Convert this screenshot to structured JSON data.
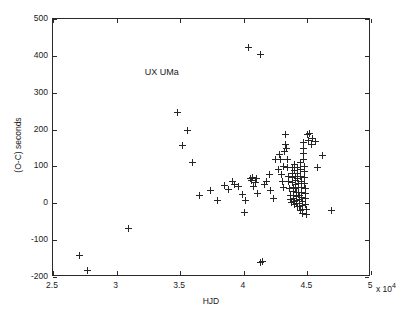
{
  "chart_data": {
    "type": "scatter",
    "title": "",
    "annotation": "UX UMa",
    "xlabel": "HJD",
    "ylabel": "(O-C) seconds",
    "x_exponent_label": "x 10",
    "x_exponent_sup": "4",
    "xlim": [
      25000,
      50000
    ],
    "ylim": [
      -200,
      500
    ],
    "xticks": [
      25000,
      30000,
      35000,
      40000,
      45000,
      50000
    ],
    "xticklabels": [
      "2.5",
      "3",
      "3.5",
      "4",
      "4.5",
      "5"
    ],
    "yticks": [
      -200,
      -100,
      0,
      100,
      200,
      300,
      400,
      500
    ],
    "yticklabels": [
      "-200",
      "-100",
      "0",
      "100",
      "200",
      "300",
      "400",
      "500"
    ],
    "grid": false,
    "legend": null,
    "marker": "plus",
    "marker_color": "#262626",
    "points": [
      [
        27100,
        -143
      ],
      [
        27700,
        -182
      ],
      [
        30900,
        -68
      ],
      [
        34800,
        247
      ],
      [
        35200,
        158
      ],
      [
        35600,
        198
      ],
      [
        36000,
        110
      ],
      [
        36500,
        20
      ],
      [
        37400,
        35
      ],
      [
        37900,
        8
      ],
      [
        38500,
        48
      ],
      [
        38800,
        38
      ],
      [
        39100,
        58
      ],
      [
        39300,
        52
      ],
      [
        39600,
        46
      ],
      [
        39900,
        24
      ],
      [
        40050,
        -24
      ],
      [
        40150,
        8
      ],
      [
        40400,
        422
      ],
      [
        40500,
        66
      ],
      [
        40600,
        62
      ],
      [
        40700,
        70
      ],
      [
        40800,
        46
      ],
      [
        40900,
        56
      ],
      [
        41000,
        68
      ],
      [
        41100,
        26
      ],
      [
        41300,
        404
      ],
      [
        41350,
        -160
      ],
      [
        41450,
        -158
      ],
      [
        41600,
        50
      ],
      [
        41800,
        60
      ],
      [
        42000,
        78
      ],
      [
        42100,
        34
      ],
      [
        42300,
        12
      ],
      [
        42500,
        120
      ],
      [
        42700,
        92
      ],
      [
        42800,
        132
      ],
      [
        42900,
        118
      ],
      [
        43000,
        78
      ],
      [
        43050,
        60
      ],
      [
        43100,
        100
      ],
      [
        43150,
        44
      ],
      [
        43200,
        140
      ],
      [
        43250,
        160
      ],
      [
        43300,
        186
      ],
      [
        43350,
        150
      ],
      [
        43400,
        120
      ],
      [
        43450,
        96
      ],
      [
        43500,
        72
      ],
      [
        43550,
        58
      ],
      [
        43600,
        40
      ],
      [
        43650,
        22
      ],
      [
        43700,
        10
      ],
      [
        43750,
        2
      ],
      [
        43800,
        98
      ],
      [
        43820,
        82
      ],
      [
        43840,
        70
      ],
      [
        43860,
        56
      ],
      [
        43880,
        44
      ],
      [
        43900,
        32
      ],
      [
        43920,
        22
      ],
      [
        43940,
        12
      ],
      [
        43960,
        4
      ],
      [
        43980,
        -2
      ],
      [
        44000,
        104
      ],
      [
        44020,
        88
      ],
      [
        44040,
        74
      ],
      [
        44060,
        62
      ],
      [
        44080,
        50
      ],
      [
        44100,
        40
      ],
      [
        44120,
        30
      ],
      [
        44140,
        18
      ],
      [
        44160,
        8
      ],
      [
        44180,
        0
      ],
      [
        44200,
        -8
      ],
      [
        44220,
        96
      ],
      [
        44240,
        80
      ],
      [
        44260,
        68
      ],
      [
        44280,
        54
      ],
      [
        44300,
        42
      ],
      [
        44320,
        30
      ],
      [
        44340,
        20
      ],
      [
        44360,
        10
      ],
      [
        44380,
        0
      ],
      [
        44400,
        -10
      ],
      [
        44420,
        -20
      ],
      [
        44440,
        112
      ],
      [
        44460,
        92
      ],
      [
        44480,
        74
      ],
      [
        44500,
        58
      ],
      [
        44520,
        44
      ],
      [
        44540,
        30
      ],
      [
        44560,
        16
      ],
      [
        44580,
        4
      ],
      [
        44600,
        -6
      ],
      [
        44620,
        -16
      ],
      [
        44640,
        -28
      ],
      [
        44660,
        166
      ],
      [
        44680,
        150
      ],
      [
        44700,
        134
      ],
      [
        44720,
        118
      ],
      [
        44740,
        100
      ],
      [
        44760,
        86
      ],
      [
        44780,
        70
      ],
      [
        44800,
        54
      ],
      [
        44820,
        40
      ],
      [
        44840,
        26
      ],
      [
        44860,
        12
      ],
      [
        44880,
        -2
      ],
      [
        44900,
        -16
      ],
      [
        44920,
        -30
      ],
      [
        45000,
        186
      ],
      [
        45100,
        170
      ],
      [
        45200,
        188
      ],
      [
        45300,
        160
      ],
      [
        45400,
        176
      ],
      [
        45600,
        168
      ],
      [
        45800,
        96
      ],
      [
        46200,
        130
      ],
      [
        46900,
        -20
      ]
    ]
  }
}
